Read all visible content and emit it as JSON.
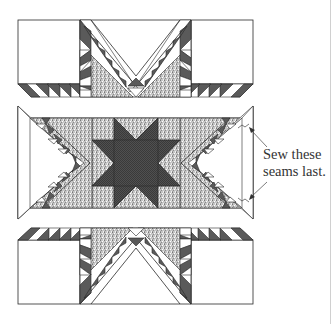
{
  "figure": {
    "type": "quilt-block-assembly-diagram",
    "sections": [
      {
        "name": "top-unit",
        "description": "Top row: two plain squares flanking a setting triangle with flying-geese star points"
      },
      {
        "name": "middle-unit",
        "description": "Center row: eight-pointed star with flying-geese strips and side triangles"
      },
      {
        "name": "bottom-unit",
        "description": "Bottom row: mirror of top unit"
      }
    ],
    "annotation": {
      "line1": "Sew these",
      "line2": "seams last."
    },
    "colors": {
      "dark_fabric": "#5a5a5a",
      "light_fabric": "#ffffff",
      "print_fabric": "#bdbdbd",
      "star_fabric": "#4a4a4a",
      "outline": "#2a2a2a"
    }
  }
}
